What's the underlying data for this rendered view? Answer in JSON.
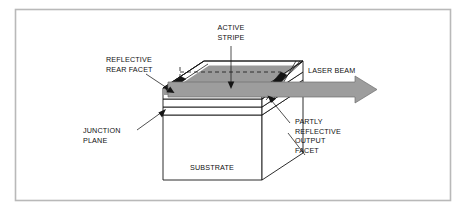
{
  "figure": {
    "type": "technical-diagram",
    "labels": {
      "active_stripe": {
        "line1": "ACTIVE",
        "line2": "STRIPE"
      },
      "reflective_rear_facet": {
        "line1": "REFLECTIVE",
        "line2": "REAR FACET"
      },
      "junction_plane": {
        "line1": "JUNCTION",
        "line2": "PLANE"
      },
      "laser_beam": {
        "line1": "LASER BEAM"
      },
      "partly_reflective_output_facet": {
        "line1": "PARTLY",
        "line2": "REFLECTIVE",
        "line3": "OUTPUT",
        "line4": "FACET"
      },
      "substrate": {
        "line1": "SUBSTRATE"
      }
    },
    "colors": {
      "frame": "#b9b9b9",
      "outline": "#151515",
      "beam": "#9d9d9d",
      "stripe": "#9a9a9a",
      "facet": "#141414",
      "background": "#ffffff"
    }
  }
}
